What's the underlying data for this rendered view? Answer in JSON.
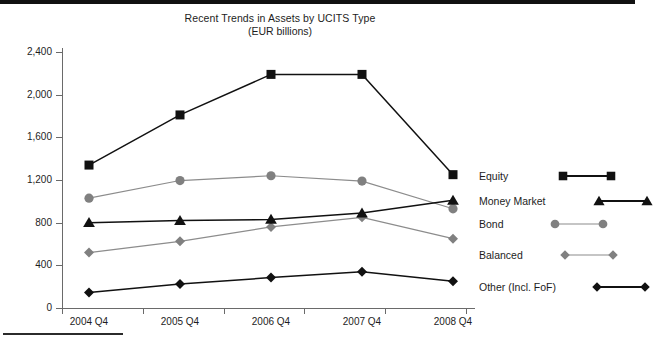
{
  "chart_data": {
    "type": "line",
    "title": "Recent Trends in Assets by UCITS Type",
    "subtitle": "(EUR billions)",
    "xlabel": "",
    "ylabel": "",
    "categories": [
      "2004 Q4",
      "2005 Q4",
      "2006 Q4",
      "2007 Q4",
      "2008 Q4"
    ],
    "ylim": [
      0,
      2400
    ],
    "y_ticks": [
      "0",
      "400",
      "800",
      "1,200",
      "1,600",
      "2,000",
      "2,400"
    ],
    "y_tick_values": [
      0,
      400,
      800,
      1200,
      1600,
      2000,
      2400
    ],
    "grid": false,
    "legend_position": "right",
    "series": [
      {
        "name": "Equity",
        "marker": "square",
        "color": "#111111",
        "line_color": "#111111",
        "values": [
          1340,
          1810,
          2190,
          2190,
          1250
        ]
      },
      {
        "name": "Money Market",
        "marker": "triangle",
        "color": "#111111",
        "line_color": "#111111",
        "values": [
          800,
          820,
          830,
          890,
          1010
        ]
      },
      {
        "name": "Bond",
        "marker": "circle",
        "color": "#808080",
        "line_color": "#8c8c8c",
        "values": [
          1030,
          1195,
          1240,
          1190,
          930
        ]
      },
      {
        "name": "Balanced",
        "marker": "diamond",
        "color": "#808080",
        "line_color": "#8c8c8c",
        "values": [
          520,
          625,
          760,
          850,
          650
        ]
      },
      {
        "name": "Other (Incl. FoF)",
        "marker": "diamond",
        "color": "#111111",
        "line_color": "#111111",
        "values": [
          145,
          225,
          285,
          340,
          250
        ]
      }
    ]
  },
  "chart": {
    "title": "Recent Trends in Assets by UCITS Type",
    "subtitle": "(EUR billions)"
  },
  "legend": {
    "items": [
      {
        "label": "Equity",
        "marker": "square-marker",
        "color": "#111111"
      },
      {
        "label": "Money Market",
        "marker": "triangle-marker",
        "color": "#111111"
      },
      {
        "label": "Bond",
        "marker": "circle-marker",
        "color": "#808080"
      },
      {
        "label": "Balanced",
        "marker": "diamond-marker",
        "color": "#808080"
      },
      {
        "label": "Other (Incl. FoF)",
        "marker": "diamond-marker",
        "color": "#111111"
      }
    ]
  },
  "axis": {
    "y_labels": [
      "2,400",
      "2,000",
      "1,600",
      "1,200",
      "800",
      "400",
      "0"
    ],
    "x_labels": [
      "2004 Q4",
      "2005 Q4",
      "2006 Q4",
      "2007 Q4",
      "2008 Q4"
    ]
  }
}
